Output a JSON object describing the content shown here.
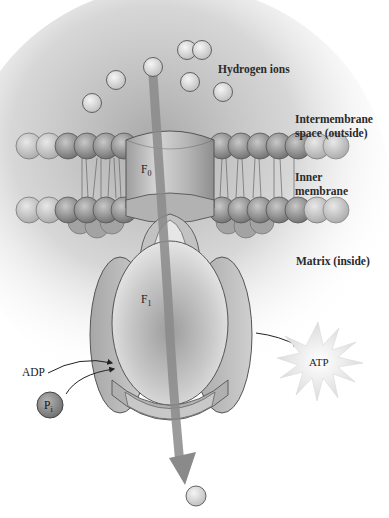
{
  "diagram": {
    "labels": {
      "hydrogen_ions": "Hydrogen ions",
      "intermembrane_line1": "Intermembrane",
      "intermembrane_line2": "space (outside)",
      "inner_membrane_line1": "Inner",
      "inner_membrane_line2": "membrane",
      "matrix": "Matrix (inside)",
      "f0_main": "F",
      "f0_sub": "0",
      "f1_main": "F",
      "f1_sub": "1",
      "adp": "ADP",
      "pi_main": "P",
      "pi_sub": "i",
      "atp": "ATP"
    },
    "colors": {
      "ion_fill": "#d8d8d8",
      "ion_stroke": "#555555",
      "protein_fill": "#c4c4c4",
      "flow_arrow": "#8a8a8a",
      "background_cloud": "#bdbdbd"
    }
  }
}
